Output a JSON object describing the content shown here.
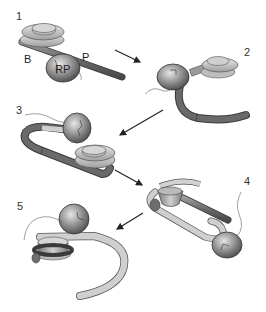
{
  "diagram": {
    "title": "",
    "steps": [
      {
        "number": "1",
        "x": 16,
        "y": 11
      },
      {
        "number": "2",
        "x": 244,
        "y": 47
      },
      {
        "number": "3",
        "x": 16,
        "y": 105
      },
      {
        "number": "4",
        "x": 244,
        "y": 176
      },
      {
        "number": "5",
        "x": 17,
        "y": 201
      }
    ],
    "component_labels": [
      {
        "text": "B",
        "x": 24,
        "y": 54
      },
      {
        "text": "RP",
        "x": 55,
        "y": 64
      },
      {
        "text": "P",
        "x": 82,
        "y": 52
      }
    ],
    "arrows": [
      {
        "from": "1",
        "to": "2"
      },
      {
        "from": "2",
        "to": "3"
      },
      {
        "from": "3",
        "to": "4"
      },
      {
        "from": "4",
        "to": "5"
      }
    ],
    "colors": {
      "rod_dark": "#6e6e6e",
      "ring_light": "#cfcfcf",
      "ring_mid": "#a9a9a9",
      "sphere": "#8c8c8c",
      "outline": "#3a3a3a",
      "arrow": "#222222",
      "tube_light": "#c8c8c8"
    }
  }
}
